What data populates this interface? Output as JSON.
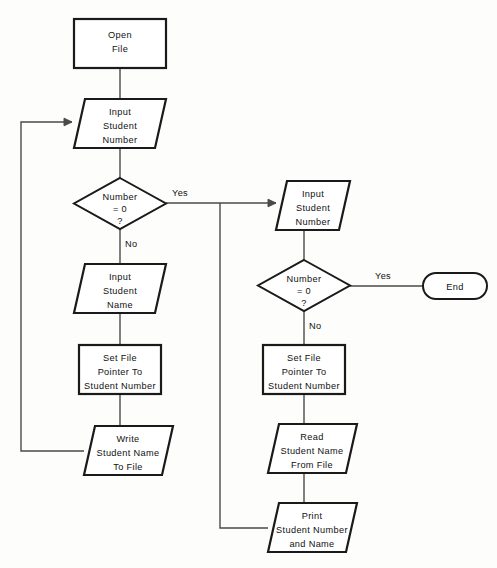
{
  "diagram": {
    "type": "flowchart",
    "colors": {
      "background": "#fdfdfc",
      "node_fill": "#ffffff",
      "node_stroke": "#1a1a1a",
      "connector": "#4a4a4a",
      "text": "#111111"
    },
    "nodes": [
      {
        "id": "open-file",
        "shape": "process",
        "lines": [
          "Open",
          "File"
        ],
        "line1": "Open",
        "line2": "File",
        "line3": ""
      },
      {
        "id": "input-student-number-left",
        "shape": "io-parallelogram",
        "lines": [
          "Input",
          "Student",
          "Number"
        ],
        "line1": "Input",
        "line2": "Student",
        "line3": "Number"
      },
      {
        "id": "decision-number-zero-left",
        "shape": "decision-diamond",
        "lines": [
          "Number",
          "= 0",
          "?"
        ],
        "line1": "Number",
        "line2": "= 0",
        "line3": "?"
      },
      {
        "id": "input-student-name",
        "shape": "io-parallelogram",
        "lines": [
          "Input",
          "Student",
          "Name"
        ],
        "line1": "Input",
        "line2": "Student",
        "line3": "Name"
      },
      {
        "id": "set-file-pointer-left",
        "shape": "process",
        "lines": [
          "Set File",
          "Pointer To",
          "Student Number"
        ],
        "line1": "Set File",
        "line2": "Pointer To",
        "line3": "Student Number"
      },
      {
        "id": "write-student-name-to-file",
        "shape": "io-parallelogram",
        "lines": [
          "Write",
          "Student Name",
          "To File"
        ],
        "line1": "Write",
        "line2": "Student Name",
        "line3": "To File"
      },
      {
        "id": "input-student-number-right",
        "shape": "io-parallelogram",
        "lines": [
          "Input",
          "Student",
          "Number"
        ],
        "line1": "Input",
        "line2": "Student",
        "line3": "Number"
      },
      {
        "id": "decision-number-zero-right",
        "shape": "decision-diamond",
        "lines": [
          "Number",
          "= 0",
          "?"
        ],
        "line1": "Number",
        "line2": "= 0",
        "line3": "?"
      },
      {
        "id": "end-terminator",
        "shape": "terminator-stadium",
        "lines": [
          "End"
        ],
        "line1": "End",
        "line2": "",
        "line3": ""
      },
      {
        "id": "set-file-pointer-right",
        "shape": "process",
        "lines": [
          "Set File",
          "Pointer  To",
          "Student Number"
        ],
        "line1": "Set File",
        "line2": "Pointer  To",
        "line3": "Student Number"
      },
      {
        "id": "read-student-name-from-file",
        "shape": "io-parallelogram",
        "lines": [
          "Read",
          "Student Name",
          "From File"
        ],
        "line1": "Read",
        "line2": "Student Name",
        "line3": "From File"
      },
      {
        "id": "print-student-number-and-name",
        "shape": "io-parallelogram",
        "lines": [
          "Print",
          "Student Number",
          "and Name"
        ],
        "line1": "Print",
        "line2": "Student Number",
        "line3": "and Name"
      }
    ],
    "edge_labels": {
      "left_yes": "Yes",
      "left_no": "No",
      "right_yes": "Yes",
      "right_no": "No"
    }
  }
}
